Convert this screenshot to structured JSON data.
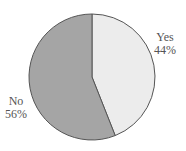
{
  "chart_data": {
    "type": "pie",
    "title": "",
    "categories": [
      "Yes",
      "No"
    ],
    "values": [
      44,
      56
    ],
    "labels": [
      "Yes 44%",
      "No 56%"
    ],
    "colors": [
      "#ececec",
      "#a5a5a5"
    ],
    "start_angle": "12 o'clock",
    "direction": "clockwise",
    "legend": "none (inline labels)"
  },
  "labels": {
    "yes_name": "Yes",
    "yes_pct": "44%",
    "no_name": "No",
    "no_pct": "56%"
  }
}
